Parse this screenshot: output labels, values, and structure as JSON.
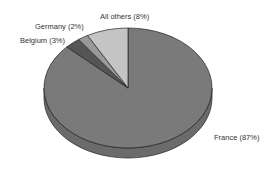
{
  "chart_data": {
    "type": "pie",
    "style": "3d",
    "title": "",
    "categories": [
      "France",
      "Belgium",
      "Germany",
      "All others"
    ],
    "values": [
      87,
      3,
      2,
      8
    ],
    "unit": "%",
    "labels": [
      "France (87%)",
      "Belgium (3%)",
      "Germany (2%)",
      "All others (8%)"
    ],
    "colors": [
      "#7a7a7a",
      "#555555",
      "#999999",
      "#c4c4c4"
    ],
    "start_angle": "12 o'clock",
    "legend": "none (slice labels)"
  },
  "labels": {
    "france": "France (87%)",
    "belgium": "Belgium (3%)",
    "germany": "Germany (2%)",
    "others": "All others (8%)"
  }
}
